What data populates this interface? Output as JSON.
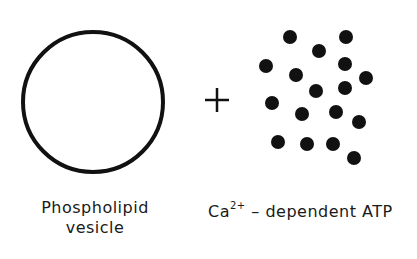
{
  "diagram": {
    "vesicle": {
      "label_line1": "Phospholipid",
      "label_line2": "vesicle",
      "circle": {
        "cx": 93,
        "cy": 102,
        "r": 70,
        "stroke": "#111111",
        "stroke_width": 4
      }
    },
    "operator": {
      "symbol": "+",
      "x": 217,
      "y": 100
    },
    "atpase": {
      "label_prefix": "Ca",
      "label_superscript": "2+",
      "label_suffix": " – dependent ATP",
      "dot_color": "#111111",
      "dot_radius": 7,
      "dots": [
        [
          290,
          37
        ],
        [
          346,
          37
        ],
        [
          319,
          51
        ],
        [
          266,
          66
        ],
        [
          345,
          64
        ],
        [
          296,
          75
        ],
        [
          366,
          78
        ],
        [
          316,
          91
        ],
        [
          345,
          88
        ],
        [
          272,
          103
        ],
        [
          302,
          114
        ],
        [
          336,
          112
        ],
        [
          359,
          122
        ],
        [
          278,
          142
        ],
        [
          307,
          144
        ],
        [
          333,
          144
        ],
        [
          354,
          158
        ]
      ]
    }
  }
}
